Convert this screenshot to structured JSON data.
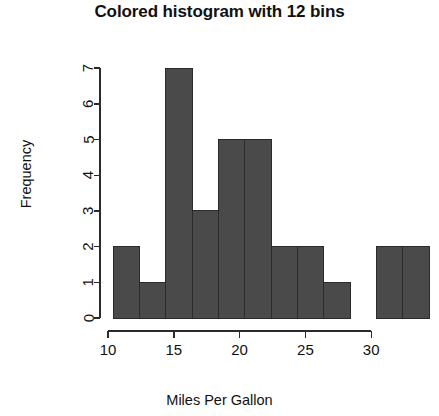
{
  "chart_data": {
    "type": "bar",
    "title": "Colored histogram with 12 bins",
    "xlabel": "Miles Per Gallon",
    "ylabel": "Frequency",
    "bar_color": "#4a4a4a",
    "bar_border_color": "#2b2b2b",
    "grid": false,
    "legend": null,
    "xlim": [
      10.0,
      33.9
    ],
    "ylim": [
      0,
      7
    ],
    "xticks": [
      10,
      15,
      20,
      25,
      30
    ],
    "xtick_labels": [
      "10",
      "15",
      "20",
      "25",
      "30"
    ],
    "yticks": [
      0,
      1,
      2,
      3,
      4,
      5,
      6,
      7
    ],
    "ytick_labels": [
      "0",
      "1",
      "2",
      "3",
      "4",
      "5",
      "6",
      "7"
    ],
    "bin_count": 12,
    "bin_edges": [
      10.4,
      12.4,
      14.4,
      16.4,
      18.4,
      20.4,
      22.4,
      24.4,
      26.4,
      28.4,
      30.4,
      32.4,
      34.4
    ],
    "categories": [
      "10.4-12.4",
      "12.4-14.4",
      "14.4-16.4",
      "16.4-18.4",
      "18.4-20.4",
      "20.4-22.4",
      "22.4-24.4",
      "24.4-26.4",
      "26.4-28.4",
      "28.4-30.4",
      "30.4-32.4",
      "32.4-34.4"
    ],
    "values": [
      2,
      1,
      7,
      3,
      5,
      5,
      2,
      2,
      1,
      0,
      2,
      2
    ]
  }
}
